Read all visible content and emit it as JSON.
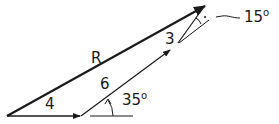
{
  "diagram": {
    "type": "vector-addition",
    "vectors": [
      {
        "name": "vector-4",
        "label": "4",
        "angle": "0°"
      },
      {
        "name": "vector-6",
        "label": "6",
        "angle": "35°"
      },
      {
        "name": "vector-3",
        "label": "3",
        "relative_angle": "15°"
      },
      {
        "name": "resultant",
        "label": "R"
      }
    ],
    "labels": {
      "r": "R",
      "four": "4",
      "six": "6",
      "three": "3",
      "angle35": "35",
      "angle15": "15",
      "degree": "o"
    },
    "colors": {
      "stroke": "#1a1a1a",
      "background": "#ffffff"
    }
  }
}
